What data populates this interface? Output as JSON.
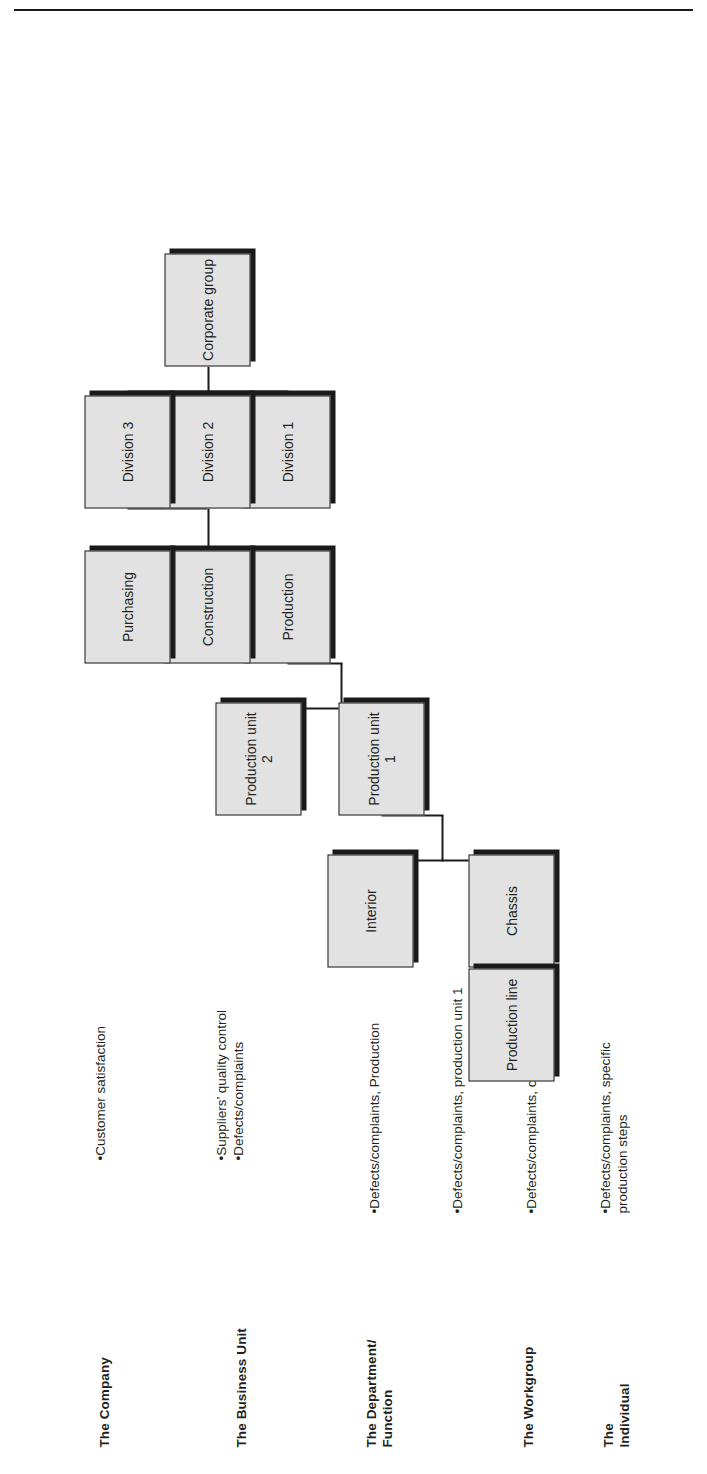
{
  "diagram": {
    "orientation": "rotated-90-ccw",
    "type": "org-hierarchy-tree",
    "levels": [
      {
        "id": "company",
        "label": "The Company"
      },
      {
        "id": "business",
        "label": "The Business Unit"
      },
      {
        "id": "department",
        "label": "The Department/\nFunction"
      },
      {
        "id": "workgroup",
        "label": "The Workgroup"
      },
      {
        "id": "individual",
        "label": "The\nIndividual"
      }
    ],
    "nodes": [
      {
        "id": "corporate-group",
        "label": "Corporate group",
        "level": "company"
      },
      {
        "id": "division-1",
        "label": "Division 1",
        "level": "business"
      },
      {
        "id": "division-2",
        "label": "Division 2",
        "level": "business"
      },
      {
        "id": "division-3",
        "label": "Division 3",
        "level": "business"
      },
      {
        "id": "production",
        "label": "Production",
        "level": "department"
      },
      {
        "id": "construction",
        "label": "Construction",
        "level": "department"
      },
      {
        "id": "purchasing",
        "label": "Purchasing",
        "level": "department"
      },
      {
        "id": "production-unit-1",
        "label": "Production unit 1",
        "level": "department"
      },
      {
        "id": "production-unit-2",
        "label": "Production unit 2",
        "level": "department"
      },
      {
        "id": "chassis",
        "label": "Chassis",
        "level": "workgroup"
      },
      {
        "id": "interior",
        "label": "Interior",
        "level": "workgroup"
      },
      {
        "id": "production-line",
        "label": "Production line",
        "level": "individual"
      }
    ],
    "annotations": [
      {
        "id": "a-company",
        "level": "company",
        "lines": [
          "•Customer satisfaction"
        ]
      },
      {
        "id": "a-business",
        "level": "business",
        "lines": [
          "•Suppliers’ quality control",
          "•Defects/complaints"
        ]
      },
      {
        "id": "a-department",
        "level": "department",
        "lines": [
          "•Defects/complaints, Production"
        ]
      },
      {
        "id": "a-unit",
        "level": "department",
        "lines": [
          "•Defects/complaints, production unit 1"
        ]
      },
      {
        "id": "a-workgroup",
        "level": "workgroup",
        "lines": [
          "•Defects/complaints, chassis"
        ]
      },
      {
        "id": "a-individual",
        "level": "individual",
        "lines": [
          "•Defects/complaints, specific",
          "production steps"
        ]
      }
    ],
    "colors": {
      "box_fill": "#e2e2e2",
      "box_border": "#1a1a1a",
      "box_shadow": "#1a1a1a",
      "text": "#231f20",
      "background": "#ffffff"
    }
  }
}
